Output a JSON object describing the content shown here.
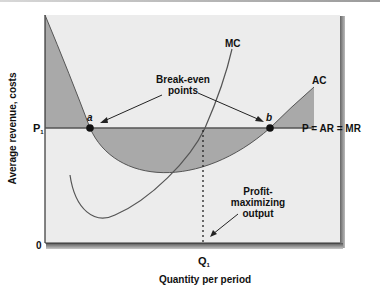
{
  "figure": {
    "y_axis_label": "Average revenue, costs",
    "x_axis_label": "Quantity per period",
    "origin_label": "0",
    "price_label": {
      "main": "P",
      "sub": "1"
    },
    "quantity_label": {
      "main": "Q",
      "sub": "1"
    },
    "curves": {
      "mc": "MC",
      "ac": "AC",
      "demand": "P = AR = MR"
    },
    "points": {
      "a": "a",
      "b": "b"
    },
    "annotations": {
      "break_even_line1": "Break-even",
      "break_even_line2": "points",
      "profit_line1": "Profit-",
      "profit_line2": "maximizing",
      "profit_line3": "output"
    },
    "colors": {
      "panel": "#ececec",
      "shaded": "#a9a9a9",
      "line": "#555555",
      "text": "#111111"
    }
  }
}
